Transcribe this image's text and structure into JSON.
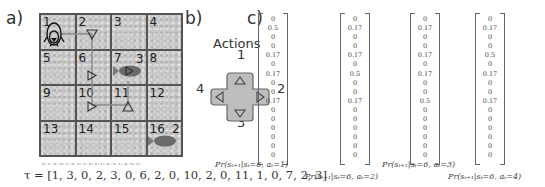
{
  "panels": {
    "a": {
      "label": "a)"
    },
    "b": {
      "label": "b)"
    },
    "c": {
      "label": "c)"
    }
  },
  "grid": {
    "rows": 4,
    "cols": 4,
    "cells": [
      "1",
      "2",
      "3",
      "4",
      "5",
      "6",
      "7",
      "8",
      "9",
      "10",
      "11",
      "12",
      "13",
      "14",
      "15",
      "16"
    ],
    "agent": {
      "icon": "penguin-icon",
      "cell": 1
    },
    "fish": [
      {
        "cell": 7,
        "reward_label": "3"
      },
      {
        "cell": 16,
        "reward_label": "2"
      }
    ],
    "path_cells": [
      1,
      2,
      6,
      10,
      11,
      7
    ],
    "path_actions": [
      "down-arrow",
      "right-arrow",
      "right-arrow",
      "up-arrow",
      "right-arrow"
    ]
  },
  "trajectory": {
    "annotation": "s₁ r₁ a₁ s₂ r₂ a₂ s₃ r₃ a₃ s₄ r₄ a₄ s₅ r₅ a₅ s₆ r₆",
    "text": "τ = [1, 3, 0, 2, 3, 0, 6, 2, 0, 10, 2, 0, 11, 1, 0, 7, 2, 3]",
    "values": [
      1,
      3,
      0,
      2,
      3,
      0,
      6,
      2,
      0,
      10,
      2,
      0,
      11,
      1,
      0,
      7,
      2,
      3
    ]
  },
  "actions": {
    "title": "Actions",
    "up": "1",
    "right": "2",
    "down": "3",
    "left": "4"
  },
  "transition_vectors": [
    {
      "caption": "Pr(sₜ₊₁|sₜ=6, aₜ=1)",
      "values": [
        "0",
        "0.5",
        "0",
        "0",
        "0.17",
        "0",
        "0.17",
        "0",
        "0",
        "0.17",
        "0",
        "0",
        "0",
        "0",
        "0",
        "0"
      ]
    },
    {
      "caption": "Pr(sₜ₊₁|sₜ=6, aₜ=2)",
      "values": [
        "0",
        "0.17",
        "0",
        "0",
        "0.17",
        "0",
        "0.5",
        "0",
        "0",
        "0.17",
        "0",
        "0",
        "0",
        "0",
        "0",
        "0"
      ]
    },
    {
      "caption": "Pr(sₜ₊₁|sₜ=6, aₜ=3)",
      "values": [
        "0",
        "0.17",
        "0",
        "0",
        "0.17",
        "0",
        "0.17",
        "0",
        "0",
        "0.5",
        "0",
        "0",
        "0",
        "0",
        "0",
        "0"
      ]
    },
    {
      "caption": "Pr(sₜ₊₁|sₜ=6, aₜ=4)",
      "values": [
        "0",
        "0.17",
        "0",
        "0",
        "0.5",
        "0",
        "0.17",
        "0",
        "0",
        "0.17",
        "0",
        "0",
        "0",
        "0",
        "0",
        "0"
      ]
    }
  ]
}
